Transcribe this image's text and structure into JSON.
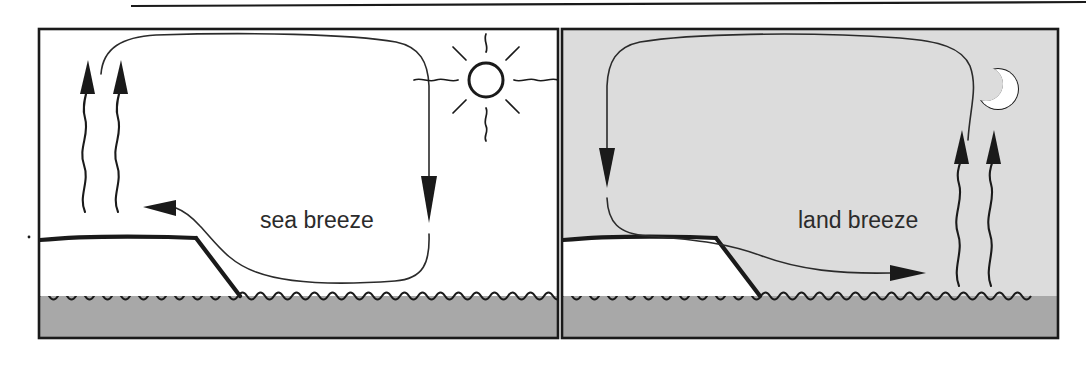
{
  "figure": {
    "name": "sea-breeze-land-breeze-diagram",
    "width": 1086,
    "height": 366,
    "background": "#ffffff",
    "top_rule": {
      "present": true,
      "color": "#1a1a1a"
    }
  },
  "colors": {
    "ink": "#1a1a1a",
    "line": "#2b2b2b",
    "sky_day": "#ffffff",
    "sky_night": "#dcdcdc",
    "land": "#ffffff",
    "water": "#a8a8a8",
    "moon_fill": "#ffffff",
    "page": "#ffffff"
  },
  "panels": [
    {
      "id": "day-panel",
      "label": "sea breeze",
      "time_of_day": "day",
      "sky_fill": "#ffffff",
      "celestial_icon": "sun-icon",
      "celestial_label": "sun",
      "land_side": "left",
      "water_side": "right",
      "rising_air_over": "land",
      "sinking_air_over": "sea",
      "surface_flow_direction": "left",
      "surface_flow_description": "sea toward land",
      "caption_text": "sea breeze",
      "rising_arrow_count": 2,
      "aloft_flow_direction": "right"
    },
    {
      "id": "night-panel",
      "label": "land breeze",
      "time_of_day": "night",
      "sky_fill": "#dcdcdc",
      "celestial_icon": "moon-icon",
      "celestial_label": "crescent moon",
      "land_side": "left",
      "water_side": "right",
      "rising_air_over": "sea",
      "sinking_air_over": "land",
      "surface_flow_direction": "right",
      "surface_flow_description": "land toward sea",
      "caption_text": "land breeze",
      "rising_arrow_count": 2,
      "aloft_flow_direction": "left"
    }
  ]
}
